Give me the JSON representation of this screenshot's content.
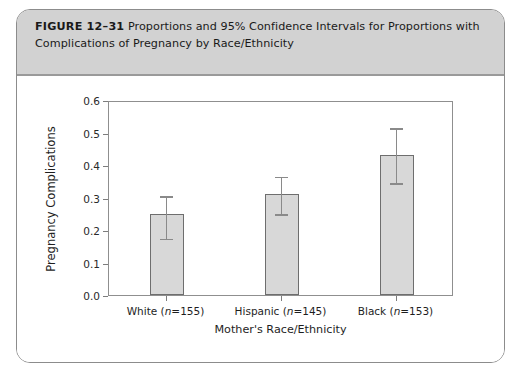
{
  "figure": {
    "label": "FIGURE 12–31",
    "caption": "Proportions and 95% Confidence Intervals for Proportions with Complications of Pregnancy by Race/Ethnicity"
  },
  "chart_data": {
    "type": "bar",
    "title": "",
    "xlabel": "Mother's Race/Ethnicity",
    "ylabel": "Pregnancy Complications",
    "categories": [
      "White (n=155)",
      "Hispanic (n=145)",
      "Black (n=153)"
    ],
    "category_parts": [
      {
        "group": "White",
        "n": 155
      },
      {
        "group": "Hispanic",
        "n": 145
      },
      {
        "group": "Black",
        "n": 153
      }
    ],
    "values": [
      0.25,
      0.31,
      0.43
    ],
    "error_bars": {
      "type": "95% confidence interval",
      "lower": [
        0.18,
        0.255,
        0.35
      ],
      "upper": [
        0.31,
        0.37,
        0.52
      ]
    },
    "ylim": [
      0.0,
      0.6
    ],
    "ytick_labels": [
      "0.0",
      "0.1",
      "0.2",
      "0.3",
      "0.4",
      "0.5",
      "0.6"
    ],
    "ytick_values": [
      0.0,
      0.1,
      0.2,
      0.3,
      0.4,
      0.5,
      0.6
    ],
    "grid": false,
    "legend": "none",
    "bar_color": "#d8d8d8",
    "bar_edge_color": "#6e6e6e",
    "error_color": "#8a8a8a"
  }
}
